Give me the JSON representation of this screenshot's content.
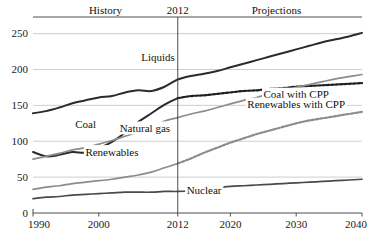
{
  "chart_data": {
    "type": "line",
    "title": "",
    "xlabel": "",
    "ylabel": "",
    "xlim": [
      1990,
      2040
    ],
    "ylim": [
      0,
      262
    ],
    "grid": true,
    "grid_axis": "y",
    "legend": "inline-labels",
    "xticks": [
      "1990",
      "2000",
      "2012",
      "2020",
      "2030",
      "2040"
    ],
    "xtick_values": [
      1990,
      2000,
      2012,
      2020,
      2030,
      2040
    ],
    "yticks": [
      "0",
      "50",
      "100",
      "150",
      "200",
      "250"
    ],
    "ytick_values": [
      0,
      50,
      100,
      150,
      200,
      250
    ],
    "annotations": [
      {
        "text": "History",
        "x": 2001,
        "y": 258
      },
      {
        "text": "2012",
        "x": 2012,
        "y": 258
      },
      {
        "text": "Projections",
        "x": 2027,
        "y": 258
      }
    ],
    "vertical_divider": {
      "x": 2012,
      "label": "2012"
    },
    "series": [
      {
        "name": "Liquids",
        "label": "Liquids",
        "color": "#2b2b2b",
        "style": "solid",
        "width": 2.0,
        "label_x": 2009,
        "label_y": 212,
        "x": [
          1990,
          1992,
          1994,
          1996,
          1998,
          2000,
          2002,
          2004,
          2006,
          2008,
          2010,
          2012,
          2014,
          2016,
          2018,
          2020,
          2022,
          2024,
          2026,
          2028,
          2030,
          2032,
          2034,
          2036,
          2038,
          2040
        ],
        "values": [
          139,
          142,
          147,
          153,
          157,
          161,
          163,
          168,
          171,
          170,
          176,
          186,
          191,
          194,
          198,
          203,
          208,
          213,
          218,
          223,
          228,
          233,
          238,
          242,
          246,
          251
        ]
      },
      {
        "name": "Coal",
        "label": "Coal",
        "color": "#2b2b2b",
        "style": "solid",
        "width": 2.0,
        "label_x": 1998,
        "label_y": 118,
        "x": [
          1990,
          1992,
          1994,
          1996,
          1998,
          2000,
          2002,
          2004,
          2006,
          2008,
          2010,
          2012
        ],
        "values": [
          85,
          79,
          81,
          85,
          84,
          90,
          99,
          112,
          127,
          139,
          151,
          160
        ]
      },
      {
        "name": "Coal with CPP",
        "label": "Coal with CPP",
        "color": "#1f1f1f",
        "style": "dotted-thick",
        "width": 2.2,
        "label_x": 2030,
        "label_y": 160,
        "x": [
          2012,
          2014,
          2016,
          2018,
          2020,
          2022,
          2024,
          2026,
          2028,
          2030,
          2032,
          2034,
          2036,
          2038,
          2040
        ],
        "values": [
          160,
          163,
          164,
          166,
          168,
          170,
          171,
          173,
          174,
          176,
          177,
          178,
          179,
          180,
          181
        ]
      },
      {
        "name": "Natural gas",
        "label": "Natural gas",
        "color": "#8c8c8c",
        "style": "solid",
        "width": 1.7,
        "label_x": 2007,
        "label_y": 113,
        "x": [
          1990,
          1992,
          1994,
          1996,
          1998,
          2000,
          2002,
          2004,
          2006,
          2008,
          2010,
          2012,
          2014,
          2016,
          2018,
          2020,
          2022,
          2024,
          2026,
          2028,
          2030,
          2032,
          2034,
          2036,
          2038,
          2040
        ],
        "values": [
          75,
          79,
          83,
          88,
          91,
          96,
          101,
          107,
          113,
          119,
          128,
          133,
          138,
          142,
          147,
          152,
          157,
          161,
          166,
          170,
          175,
          179,
          183,
          187,
          190,
          193
        ]
      },
      {
        "name": "Renewables",
        "label": "Renewables",
        "color": "#8c8c8c",
        "style": "solid",
        "width": 1.7,
        "label_x": 2002,
        "label_y": 80,
        "x": [
          1990,
          1992,
          1994,
          1996,
          1998,
          2000,
          2002,
          2004,
          2006,
          2008,
          2010,
          2012
        ],
        "values": [
          33,
          36,
          38,
          41,
          43,
          45,
          47,
          50,
          53,
          57,
          63,
          69
        ]
      },
      {
        "name": "Renewables with CPP",
        "label": "Renewables with CPP",
        "color": "#8c8c8c",
        "style": "dotted-thick",
        "width": 2.2,
        "label_x": 2030,
        "label_y": 146,
        "x": [
          2012,
          2014,
          2016,
          2018,
          2020,
          2022,
          2024,
          2026,
          2028,
          2030,
          2032,
          2034,
          2036,
          2038,
          2040
        ],
        "values": [
          69,
          76,
          84,
          91,
          98,
          104,
          110,
          115,
          120,
          125,
          129,
          132,
          135,
          138,
          141
        ]
      },
      {
        "name": "Nuclear",
        "label": "Nuclear",
        "color": "#4a4a4a",
        "style": "solid",
        "width": 1.7,
        "label_x": 2016,
        "label_y": 26,
        "x": [
          1990,
          1992,
          1994,
          1996,
          1998,
          2000,
          2002,
          2004,
          2006,
          2008,
          2010,
          2012,
          2014,
          2016,
          2018,
          2020,
          2022,
          2024,
          2026,
          2028,
          2030,
          2032,
          2034,
          2036,
          2038,
          2040
        ],
        "values": [
          20,
          22,
          23,
          25,
          26,
          27,
          28,
          29,
          29,
          29,
          30,
          30,
          31,
          33,
          35,
          37,
          38,
          39,
          40,
          41,
          42,
          43,
          44,
          45,
          46,
          47
        ]
      }
    ]
  },
  "colors": {
    "grid": "#b9b9b9",
    "axis": "#3a3a3a",
    "dark_series": "#2b2b2b",
    "gray_series": "#8c8c8c",
    "background": "#ffffff"
  }
}
